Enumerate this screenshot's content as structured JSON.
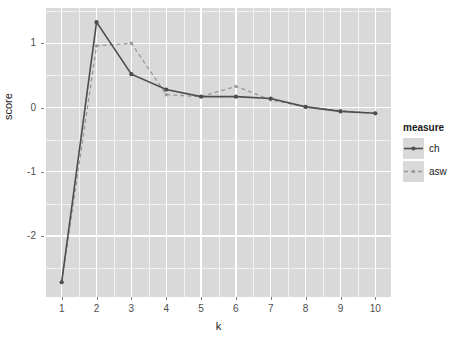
{
  "chart_data": {
    "type": "line",
    "title": "",
    "xlabel": "k",
    "ylabel": "score",
    "xlim": [
      0.55,
      10.45
    ],
    "ylim": [
      -2.95,
      1.55
    ],
    "xticks": [
      1,
      2,
      3,
      4,
      5,
      6,
      7,
      8,
      9,
      10
    ],
    "xtick_labels": [
      "1",
      "2",
      "3",
      "4",
      "5",
      "6",
      "7",
      "8",
      "9",
      "10"
    ],
    "yticks": [
      1,
      0,
      -1,
      -2
    ],
    "ytick_labels": [
      "1",
      "0",
      "-1",
      "-2"
    ],
    "grid": true,
    "legend_position": "right",
    "legend_title": "measure",
    "x": [
      1,
      2,
      3,
      4,
      5,
      6,
      7,
      8,
      9,
      10
    ],
    "series": [
      {
        "name": "ch",
        "label": "ch",
        "color": "#4d4d4d",
        "linetype": "solid",
        "values": [
          -2.72,
          1.33,
          0.52,
          0.28,
          0.17,
          0.17,
          0.14,
          0.01,
          -0.06,
          -0.09
        ]
      },
      {
        "name": "asw",
        "label": "asw",
        "color": "#999999",
        "linetype": "dashed",
        "values": [
          -2.72,
          0.96,
          1.0,
          0.2,
          0.17,
          0.33,
          0.12,
          0.01,
          -0.05,
          -0.09
        ]
      }
    ]
  },
  "panel": {
    "background_color": "#d9d9d9",
    "major_grid_color": "#ffffff",
    "minor_grid_color": "#f2f2f2"
  }
}
